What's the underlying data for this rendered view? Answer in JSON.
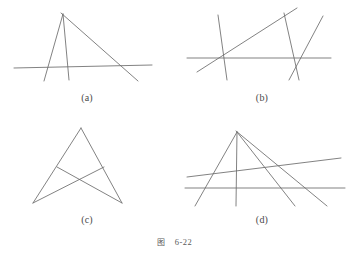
{
  "plate": {
    "caption_word": "图",
    "caption_number": "6-22",
    "stroke_color": "#6b6b6b",
    "background_color": "#ffffff"
  },
  "panels": [
    {
      "id": "a",
      "label": "(a)",
      "description": "Three concurrent lines meeting at a common apex, cut by a transversal base line",
      "viewbox": "0 0 174 94",
      "lines": [
        {
          "name": "base-transversal",
          "x1": 14,
          "y1": 68,
          "x2": 152,
          "y2": 65
        },
        {
          "name": "left-cevian",
          "x1": 63,
          "y1": 14,
          "x2": 44,
          "y2": 81
        },
        {
          "name": "middle-cevian",
          "x1": 63,
          "y1": 14,
          "x2": 69,
          "y2": 80
        },
        {
          "name": "right-cevian",
          "x1": 61,
          "y1": 13,
          "x2": 138,
          "y2": 81
        }
      ]
    },
    {
      "id": "b",
      "label": "(b)",
      "description": "Four lines in general position forming two distinct crossing nodes on a common base line",
      "viewbox": "0 0 174 94",
      "lines": [
        {
          "name": "base-transversal",
          "x1": 12,
          "y1": 58,
          "x2": 156,
          "y2": 58
        },
        {
          "name": "left-steep-line",
          "x1": 43,
          "y1": 15,
          "x2": 52,
          "y2": 80
        },
        {
          "name": "long-diagonal",
          "x1": 22,
          "y1": 72,
          "x2": 122,
          "y2": 8
        },
        {
          "name": "right-down-line",
          "x1": 109,
          "y1": 13,
          "x2": 124,
          "y2": 80
        },
        {
          "name": "right-up-line",
          "x1": 148,
          "y1": 16,
          "x2": 114,
          "y2": 80
        }
      ]
    },
    {
      "id": "c",
      "label": "(c)",
      "description": "Triangle-like arrangement with two crossing cevians forming an arrowhead shape",
      "viewbox": "0 0 174 94",
      "lines": [
        {
          "name": "left-side",
          "x1": 81,
          "y1": 6,
          "x2": 33,
          "y2": 81
        },
        {
          "name": "right-side",
          "x1": 81,
          "y1": 6,
          "x2": 122,
          "y2": 81
        },
        {
          "name": "left-cross-chord",
          "x1": 57,
          "y1": 45,
          "x2": 122,
          "y2": 81
        },
        {
          "name": "right-cross-chord",
          "x1": 104,
          "y1": 45,
          "x2": 33,
          "y2": 81
        }
      ]
    },
    {
      "id": "d",
      "label": "(d)",
      "description": "Pencil of four concurrent lines through a single apex crossed by two transversals",
      "viewbox": "0 0 174 94",
      "lines": [
        {
          "name": "base-transversal",
          "x1": 10,
          "y1": 66,
          "x2": 170,
          "y2": 66
        },
        {
          "name": "slanted-transversal",
          "x1": 12,
          "y1": 55,
          "x2": 166,
          "y2": 36
        },
        {
          "name": "pencil-line-1",
          "x1": 62,
          "y1": 10,
          "x2": 20,
          "y2": 84
        },
        {
          "name": "pencil-line-2",
          "x1": 62,
          "y1": 10,
          "x2": 61,
          "y2": 84
        },
        {
          "name": "pencil-line-3",
          "x1": 62,
          "y1": 10,
          "x2": 120,
          "y2": 84
        },
        {
          "name": "pencil-line-4",
          "x1": 61,
          "y1": 9,
          "x2": 152,
          "y2": 84
        }
      ]
    }
  ]
}
